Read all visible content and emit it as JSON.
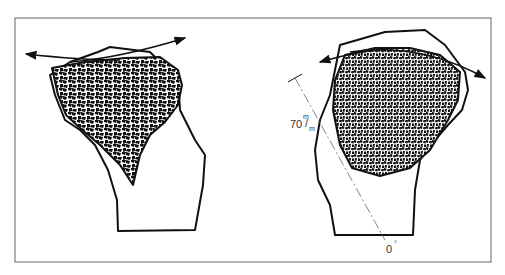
{
  "figure": {
    "panels": [
      {
        "id": "left",
        "description": "Bone section with cancellous (trabecular) core and curved articular-surface arrow"
      },
      {
        "id": "right",
        "description": "Bone section with cancellous core, curved arrow, dimension line and angle marker"
      }
    ],
    "annotations": {
      "distance_value": "70",
      "distance_unit_top": "m",
      "distance_unit_bottom": "m",
      "angle_label": "0",
      "angle_unit": "°"
    },
    "colors": {
      "ink": "#111111",
      "frame": "#666666",
      "background": "#ffffff"
    }
  }
}
